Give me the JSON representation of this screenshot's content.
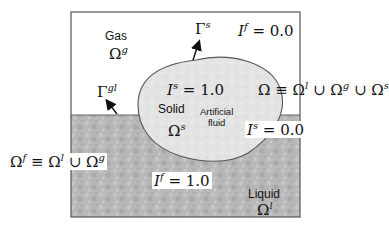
{
  "diagram": {
    "title": "",
    "regions": {
      "gas": {
        "name": "Gas",
        "symbol": "Ω",
        "sup": "g"
      },
      "liquid": {
        "name": "Liquid",
        "symbol": "Ω",
        "sup": "l"
      },
      "solid": {
        "name": "Solid",
        "symbol": "Ω",
        "sup": "s",
        "note_line1": "Artificial",
        "note_line2": "fluid"
      }
    },
    "boundaries": {
      "gas_liquid": {
        "symbol": "Γ",
        "sup": "gl"
      },
      "solid": {
        "symbol": "Γ",
        "sup": "s"
      }
    },
    "indicators": {
      "fluid_top": {
        "symbol": "I",
        "sup": "f",
        "eq": " = ",
        "value": "0.0"
      },
      "solid_in": {
        "symbol": "I",
        "sup": "s",
        "eq": " = ",
        "value": "1.0"
      },
      "solid_out": {
        "symbol": "I",
        "sup": "s",
        "eq": " = ",
        "value": "0.0"
      },
      "fluid_bottom": {
        "symbol": "I",
        "sup": "f",
        "eq": " = ",
        "value": "1.0"
      }
    },
    "equations": {
      "domain": {
        "lhs": "Ω",
        "op": " ≡ ",
        "t1": "Ω",
        "t1sup": "l",
        "u1": " ∪ ",
        "t2": "Ω",
        "t2sup": "g",
        "u2": " ∪ ",
        "t3": "Ω",
        "t3sup": "s"
      },
      "fluid_domain": {
        "lhs": "Ω",
        "lhssup": "f",
        "op": " ≡ ",
        "t1": "Ω",
        "t1sup": "l",
        "u1": " ∪ ",
        "t2": "Ω",
        "t2sup": "g"
      }
    },
    "colors": {
      "gas": "#ffffff",
      "liquid": "#b4b4b4",
      "solid": "#e6e6e6",
      "outline": "#555555",
      "arrow": "#111111"
    }
  }
}
